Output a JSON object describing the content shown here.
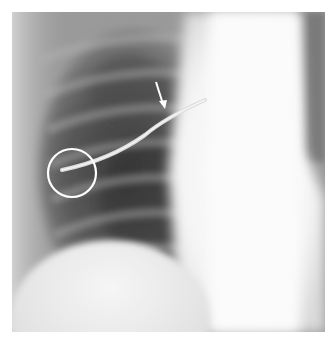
{
  "figure": {
    "type": "chest-radiograph",
    "annotations": [
      {
        "kind": "arrow",
        "semantic": "arrow-marker",
        "color": "#ffffff",
        "position": {
          "x": 163,
          "y": 86
        },
        "points_to": "proximal segment of line near hilum"
      },
      {
        "kind": "circle",
        "semantic": "circle-marker",
        "color": "#ffffff",
        "center": {
          "x": 72,
          "y": 173
        },
        "radius": 24,
        "highlights": "distal tip of line in lateral lung"
      }
    ],
    "colors": {
      "background": "#ffffff",
      "mediastinum": "#f8f8f8",
      "lung_dark": "#3a3a3a",
      "soft_tissue": "#9a9a9a",
      "annotation": "#ffffff"
    }
  }
}
